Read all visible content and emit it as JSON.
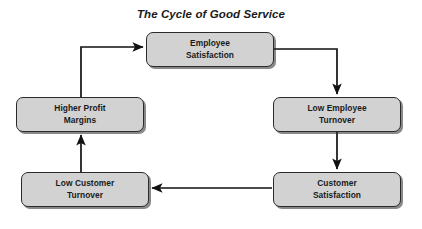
{
  "title": "The Cycle of Good Service",
  "diagram": {
    "type": "cycle-flowchart",
    "direction": "clockwise",
    "colors": {
      "node_fill": "#d2d2d2",
      "node_border": "#2b2b2b",
      "arrow": "#111111",
      "text": "#1a1a1a",
      "background": "#ffffff"
    },
    "nodes": [
      {
        "id": "employee-satisfaction",
        "label": "Employee\nSatisfaction"
      },
      {
        "id": "low-employee-turnover",
        "label": "Low Employee\nTurnover"
      },
      {
        "id": "customer-satisfaction",
        "label": "Customer\nSatisfaction"
      },
      {
        "id": "low-customer-turnover",
        "label": "Low Customer\nTurnover"
      },
      {
        "id": "higher-profit-margins",
        "label": "Higher Profit\nMargins"
      }
    ],
    "edges": [
      {
        "from": "employee-satisfaction",
        "to": "low-employee-turnover"
      },
      {
        "from": "low-employee-turnover",
        "to": "customer-satisfaction"
      },
      {
        "from": "customer-satisfaction",
        "to": "low-customer-turnover"
      },
      {
        "from": "low-customer-turnover",
        "to": "higher-profit-margins"
      },
      {
        "from": "higher-profit-margins",
        "to": "employee-satisfaction"
      }
    ]
  }
}
